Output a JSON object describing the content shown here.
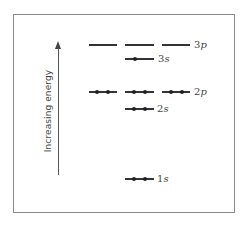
{
  "diagram": {
    "axis": {
      "label": "Increasing energy",
      "direction": "up"
    },
    "levels": [
      {
        "id": "3p",
        "label_n": "3",
        "label_orbital": "p",
        "orbitals": [
          {
            "electrons": 0
          },
          {
            "electrons": 0
          },
          {
            "electrons": 0
          }
        ]
      },
      {
        "id": "3s",
        "label_n": "3",
        "label_orbital": "s",
        "orbitals": [
          {
            "electrons": 1
          }
        ]
      },
      {
        "id": "2p",
        "label_n": "2",
        "label_orbital": "p",
        "orbitals": [
          {
            "electrons": 2
          },
          {
            "electrons": 2
          },
          {
            "electrons": 2
          }
        ]
      },
      {
        "id": "2s",
        "label_n": "2",
        "label_orbital": "s",
        "orbitals": [
          {
            "electrons": 2
          }
        ]
      },
      {
        "id": "1s",
        "label_n": "1",
        "label_orbital": "s",
        "orbitals": [
          {
            "electrons": 2
          }
        ]
      }
    ]
  }
}
